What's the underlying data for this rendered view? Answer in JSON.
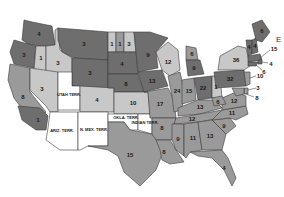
{
  "map": {
    "type": "historical-us-states-map",
    "colors": {
      "dark": "#6e6e6e",
      "medium": "#9a9a9a",
      "light": "#c8c8c8",
      "territory": "#ffffff",
      "border": "#3a3a3a"
    },
    "regions": [
      {
        "id": "WA",
        "label": "4",
        "shade": "dark"
      },
      {
        "id": "OR",
        "label": "3",
        "shade": "dark"
      },
      {
        "id": "CA",
        "label": "8",
        "shade": "medium"
      },
      {
        "id": "CA-S",
        "label": "1",
        "shade": "dark"
      },
      {
        "id": "ID",
        "label": "3",
        "shade": "light"
      },
      {
        "id": "NV",
        "label": "3",
        "shade": "light"
      },
      {
        "id": "OR-ID-strip",
        "label": "1",
        "shade": "light"
      },
      {
        "id": "MT",
        "label": "3",
        "shade": "dark"
      },
      {
        "id": "WY",
        "label": "3",
        "shade": "dark"
      },
      {
        "id": "UT",
        "label": "UTAH TERR.",
        "shade": "territory"
      },
      {
        "id": "CO",
        "label": "4",
        "shade": "light"
      },
      {
        "id": "AZ",
        "label": "ARIZ. TERR.",
        "shade": "territory"
      },
      {
        "id": "NM",
        "label": "N. MEX. TERR.",
        "shade": "territory"
      },
      {
        "id": "ND-1",
        "label": "1",
        "shade": "light"
      },
      {
        "id": "ND-2",
        "label": "1",
        "shade": "medium"
      },
      {
        "id": "ND-3",
        "label": "3",
        "shade": "light"
      },
      {
        "id": "SD",
        "label": "4",
        "shade": "dark"
      },
      {
        "id": "NE",
        "label": "8",
        "shade": "dark"
      },
      {
        "id": "KS",
        "label": "10",
        "shade": "light"
      },
      {
        "id": "OK",
        "label": "OKLA. TERR.",
        "shade": "territory"
      },
      {
        "id": "IT",
        "label": "INDIAN TERR.",
        "shade": "territory"
      },
      {
        "id": "TX",
        "label": "15",
        "shade": "medium"
      },
      {
        "id": "MN",
        "label": "9",
        "shade": "dark"
      },
      {
        "id": "IA",
        "label": "13",
        "shade": "dark"
      },
      {
        "id": "MO",
        "label": "17",
        "shade": "medium"
      },
      {
        "id": "AR",
        "label": "8",
        "shade": "medium"
      },
      {
        "id": "LA",
        "label": "8",
        "shade": "medium"
      },
      {
        "id": "WI",
        "label": "12",
        "shade": "light"
      },
      {
        "id": "IL",
        "label": "24",
        "shade": "medium"
      },
      {
        "id": "MI-N",
        "label": "6",
        "shade": "medium"
      },
      {
        "id": "MI",
        "label": "9",
        "shade": "dark"
      },
      {
        "id": "IN",
        "label": "15",
        "shade": "medium"
      },
      {
        "id": "OH",
        "label": "22",
        "shade": "dark"
      },
      {
        "id": "WV",
        "label": "1",
        "shade": "light"
      },
      {
        "id": "KY",
        "label": "13",
        "shade": "medium"
      },
      {
        "id": "TN",
        "label": "12",
        "shade": "medium"
      },
      {
        "id": "MS",
        "label": "9",
        "shade": "medium"
      },
      {
        "id": "AL",
        "label": "11",
        "shade": "medium"
      },
      {
        "id": "GA",
        "label": "13",
        "shade": "medium"
      },
      {
        "id": "FL",
        "label": "4",
        "shade": "medium"
      },
      {
        "id": "SC",
        "label": "9",
        "shade": "medium"
      },
      {
        "id": "NC",
        "label": "11",
        "shade": "medium"
      },
      {
        "id": "VA",
        "label": "12",
        "shade": "medium"
      },
      {
        "id": "WV2",
        "label": "6",
        "shade": "medium"
      },
      {
        "id": "PA",
        "label": "32",
        "shade": "dark"
      },
      {
        "id": "NY",
        "label": "36",
        "shade": "light"
      },
      {
        "id": "VT",
        "label": "4",
        "shade": "dark"
      },
      {
        "id": "NH",
        "label": "4",
        "shade": "dark"
      },
      {
        "id": "ME",
        "label": "6",
        "shade": "dark"
      },
      {
        "id": "MA",
        "label": "15",
        "shade": "dark",
        "callout": true
      },
      {
        "id": "RI",
        "label": "4",
        "shade": "dark",
        "callout": true
      },
      {
        "id": "CT",
        "label": "6",
        "shade": "dark",
        "callout": true
      },
      {
        "id": "NJ",
        "label": "10",
        "shade": "medium",
        "callout": true
      },
      {
        "id": "DE",
        "label": "3",
        "shade": "medium",
        "callout": true
      },
      {
        "id": "MD",
        "label": "8",
        "shade": "medium",
        "callout": true
      }
    ],
    "edge_glyph": "E"
  }
}
